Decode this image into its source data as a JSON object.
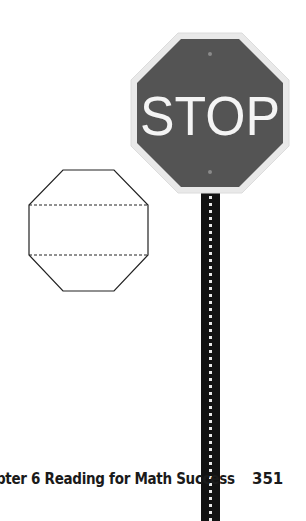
{
  "stop_sign": {
    "text": "STOP",
    "fill_color": "#545454",
    "border_color": "#f2f2f2",
    "text_color": "#f4f4f4"
  },
  "post": {
    "color": "#121212",
    "dot_color": "#e8e8e8"
  },
  "octagon_figure": {
    "stroke_color": "#222222",
    "dashed_fold_lines": 2
  },
  "footer": {
    "chapter_text": "pter 6 Reading for Math Success",
    "page_number": "351"
  }
}
